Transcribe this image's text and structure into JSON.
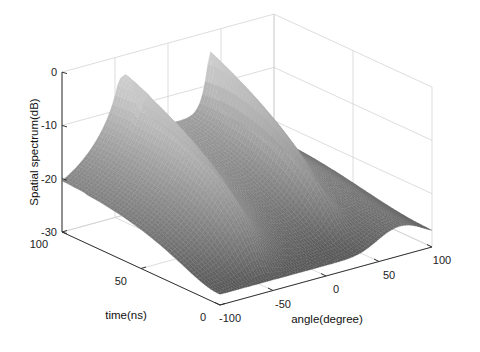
{
  "chart_data": {
    "type": "surface3d",
    "title": "",
    "xlabel": "angle(degree)",
    "ylabel": "time(ns)",
    "zlabel": "Spatial spectrum(dB)",
    "xlim": [
      -100,
      100
    ],
    "ylim": [
      0,
      100
    ],
    "zlim": [
      -30,
      0
    ],
    "x_ticks": [
      -100,
      -50,
      0,
      50,
      100
    ],
    "y_ticks": [
      0,
      50,
      100
    ],
    "z_ticks": [
      -30,
      -20,
      -10,
      0
    ],
    "x_tick_labels": [
      "-100",
      "-50",
      "0",
      "50",
      "100"
    ],
    "y_tick_labels": [
      "0",
      "50",
      "100"
    ],
    "z_tick_labels": [
      "-30",
      "-20",
      "-10",
      "0"
    ],
    "grid": true,
    "colormap": "grayscale",
    "floor_level_db": -28,
    "peaks": [
      {
        "name": "source-1",
        "angle_at_t0": -55,
        "angle_at_t100": -40,
        "peak_db": -4,
        "double_tip": true
      },
      {
        "name": "source-2",
        "angle_at_t0": 35,
        "angle_at_t100": 40,
        "peak_db": -4,
        "double_tip": false
      }
    ],
    "secondary_ridge": {
      "angle_range": [
        0,
        60
      ],
      "time": 100,
      "level_db": -17
    }
  },
  "labels": {
    "zlabel": "Spatial spectrum(dB)",
    "xlabel": "angle(degree)",
    "ylabel": "time(ns)"
  }
}
